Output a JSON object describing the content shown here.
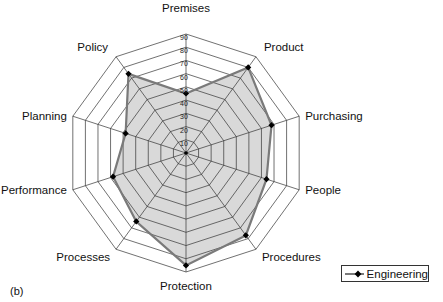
{
  "chart_data": {
    "type": "radar",
    "title": "",
    "categories": [
      "Premises",
      "Product",
      "Purchasing",
      "People",
      "Procedures",
      "Protection",
      "Processes",
      "Performance",
      "Planning",
      "Policy"
    ],
    "series": [
      {
        "name": "Engineering",
        "values": [
          45,
          80,
          68,
          64,
          77,
          85,
          64,
          58,
          48,
          74
        ]
      }
    ],
    "ticks": [
      10,
      20,
      30,
      40,
      50,
      60,
      70,
      80,
      90
    ],
    "rlim": [
      0,
      90
    ],
    "grid": true,
    "legend_position": "bottom-right",
    "colors": {
      "series_line": "#7a7a7a",
      "fill": "#d9d9d9",
      "marker": "#000000",
      "grid": "#333333"
    }
  },
  "panel_label": "(b)",
  "legend": {
    "label": "Engineering"
  }
}
